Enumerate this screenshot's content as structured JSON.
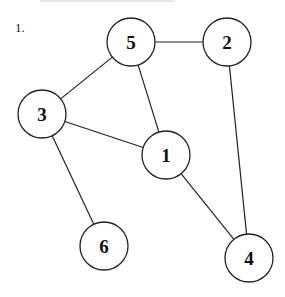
{
  "problem": {
    "number": "1."
  },
  "graph": {
    "nodes": [
      {
        "id": "5",
        "label": "5",
        "x": 131,
        "y": 42
      },
      {
        "id": "2",
        "label": "2",
        "x": 227,
        "y": 42
      },
      {
        "id": "3",
        "label": "3",
        "x": 42,
        "y": 114
      },
      {
        "id": "1",
        "label": "1",
        "x": 166,
        "y": 155
      },
      {
        "id": "6",
        "label": "6",
        "x": 104,
        "y": 246
      },
      {
        "id": "4",
        "label": "4",
        "x": 249,
        "y": 258
      }
    ],
    "edges": [
      [
        "5",
        "2"
      ],
      [
        "5",
        "3"
      ],
      [
        "5",
        "1"
      ],
      [
        "3",
        "1"
      ],
      [
        "3",
        "6"
      ],
      [
        "2",
        "4"
      ],
      [
        "1",
        "4"
      ]
    ],
    "node_radius": 24,
    "stroke_color": "#222222"
  }
}
